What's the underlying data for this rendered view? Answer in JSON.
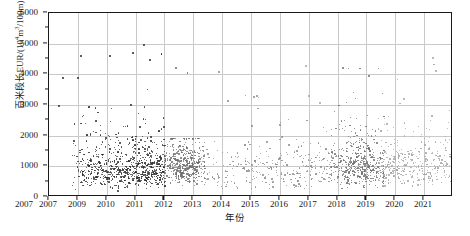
{
  "chart_data": {
    "type": "scatter",
    "title": "",
    "xlabel": "年份",
    "ylabel": "百米段长EUR/(10⁴m³/100m)",
    "ylabel_main": "百米段长EUR/(10",
    "ylabel_sup1": "4",
    "ylabel_mid": "m",
    "ylabel_sup2": "3",
    "ylabel_tail": "/100m)",
    "xlim": [
      2007,
      2021
    ],
    "ylim": [
      0,
      6000
    ],
    "grid": true,
    "legend": "none",
    "x_ticks": [
      2007,
      2007,
      2009,
      2010,
      2011,
      2012,
      2013,
      2014,
      2015,
      2016,
      2017,
      2018,
      2019,
      2020,
      2021
    ],
    "x_tick_labels": [
      "2007",
      "2007",
      "2009",
      "2010",
      "2011",
      "2012",
      "2013",
      "2014",
      "2015",
      "2016",
      "2017",
      "2018",
      "2019",
      "2020",
      "2021"
    ],
    "y_ticks": [
      0,
      1000,
      2000,
      3000,
      4000,
      5000,
      6000
    ],
    "y_tick_labels": [
      "0",
      "1000",
      "2000",
      "3000",
      "4000",
      "5000",
      "6000"
    ],
    "y_minor_ticks": [
      500,
      1500,
      2500,
      3500,
      4500,
      5500
    ],
    "colors": {
      "dark": "#2b2b2b",
      "mid": "#6e6e6e",
      "light": "#a3a3a3",
      "grid": "#c9c9c9",
      "axis": "#1a1a1a",
      "background": "#ffffff"
    },
    "series": [
      {
        "name": "2008-2010 dense cluster",
        "color": "#2b2b2b",
        "marker": "circle",
        "description": "Dark dense cluster spanning 2008 through early 2011, concentrated below 2000, long tail up to 5000",
        "n_points": 760,
        "x_range": [
          2007.8,
          2011.05
        ],
        "y_range": [
          150,
          5000
        ],
        "y_mode": 950
      },
      {
        "name": "2011-2012 block cluster",
        "color": "#6e6e6e",
        "marker": "circle",
        "description": "Mid-gray saturated block between 2011 and 2012.3, mostly 300-1800",
        "n_points": 420,
        "x_range": [
          2011.0,
          2012.4
        ],
        "y_range": [
          250,
          1900
        ],
        "y_mode": 1050
      },
      {
        "name": "2012-2016 sparse band",
        "color": "#8a8a8a",
        "marker": "circle",
        "description": "Sparser mid-gray scatter from 2012 to 2016, mostly below 1800 with occasional points to 3300",
        "n_points": 300,
        "x_range": [
          2012.2,
          2016.9
        ],
        "y_range": [
          150,
          3300
        ],
        "y_mode": 900
      },
      {
        "name": "2017-2018 dense cluster",
        "color": "#6e6e6e",
        "marker": "circle",
        "description": "Second dense gray cluster at 2017-2018, concentrated 400-2000, tail to 4200",
        "n_points": 430,
        "x_range": [
          2016.8,
          2018.6
        ],
        "y_range": [
          200,
          4200
        ],
        "y_mode": 1050
      },
      {
        "name": "2018-2021 light band",
        "color": "#a3a3a3",
        "marker": "circle",
        "description": "Lighter gray scatter trailing from 2018 to 2021, mostly 400-2200, some points to 4600",
        "n_points": 330,
        "x_range": [
          2018.4,
          2021.0
        ],
        "y_range": [
          250,
          4600
        ],
        "y_mode": 1000
      }
    ]
  }
}
